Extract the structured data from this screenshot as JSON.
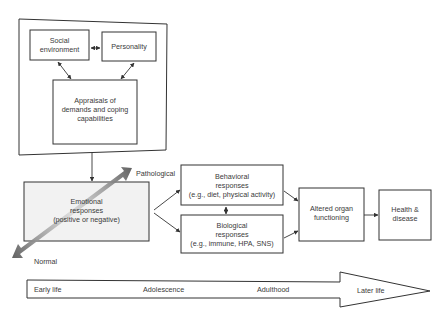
{
  "diagram": {
    "nodes": {
      "social_environment": {
        "lines": [
          "Social",
          "environment"
        ]
      },
      "personality": {
        "lines": [
          "Personality"
        ]
      },
      "appraisals": {
        "lines": [
          "Appraisals of",
          "demands and coping",
          "capabilities"
        ]
      },
      "emotional": {
        "lines": [
          "Emotional",
          "responses",
          "(positive or negative)"
        ]
      },
      "behavioral": {
        "lines": [
          "Behavioral",
          "responses",
          "(e.g., diet, physical activity)"
        ]
      },
      "biological": {
        "lines": [
          "Biological",
          "responses",
          "(e.g., immune, HPA, SNS)"
        ]
      },
      "altered_organ": {
        "lines": [
          "Altered organ",
          "functioning"
        ]
      },
      "health": {
        "lines": [
          "Health &",
          "disease"
        ]
      }
    },
    "spectrum": {
      "high_label": "Pathological",
      "low_label": "Normal"
    },
    "timeline": {
      "stages": [
        "Early life",
        "Adolescence",
        "Adulthood",
        "Later life"
      ]
    },
    "colors": {
      "stroke": "#333333",
      "spectrum_dark": "#555555",
      "spectrum_light": "#d8d8d8",
      "emotional_fill": "#f2f2f2"
    }
  }
}
